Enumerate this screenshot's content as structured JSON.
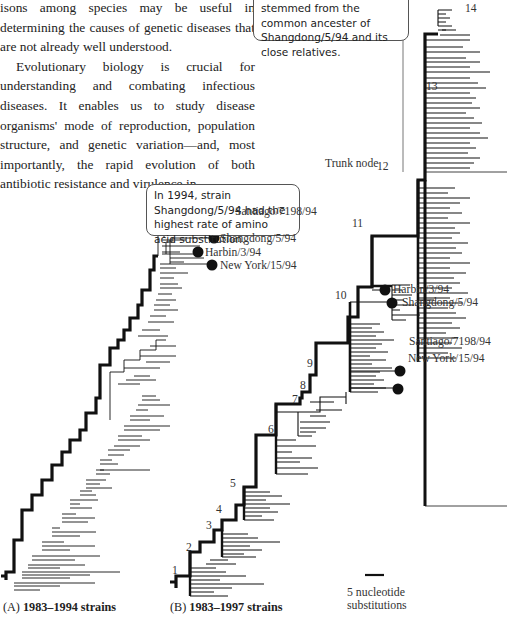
{
  "body_text": {
    "paragraph1": "isons among species may be useful in determining the causes of genetic diseases that are not already well understood.",
    "paragraph2": "Evolutionary biology is crucial for understanding and combating infectious diseases. It enables us to study disease organisms' mode of reproduction, population structure, and genetic variation—and, most importantly, the rapid evolution of both antibiotic resistance and virulence in"
  },
  "callouts": {
    "top": "stemmed from the common ancester of Shangdong/5/94 and its close relatives.",
    "middle": "In 1994, strain Shangdong/5/94 had the highest rate of amino acid substitution."
  },
  "tree_a": {
    "caption_letter": "(A)",
    "caption_title": "1983–1994 strains",
    "strains": [
      {
        "label": "Santiago/7198/94"
      },
      {
        "label": "Shangdong/5/94"
      },
      {
        "label": "Harbin/3/94"
      },
      {
        "label": "New York/15/94"
      }
    ]
  },
  "tree_b": {
    "caption_letter": "(B)",
    "caption_title": "1983–1997 strains",
    "trunk_node_label": "Trunk node",
    "nodes": [
      "1",
      "2",
      "3",
      "4",
      "5",
      "6",
      "7",
      "8",
      "9",
      "10",
      "11",
      "12",
      "13",
      "14"
    ],
    "strains": [
      {
        "label": "Shangdong/5/94"
      },
      {
        "label": "Harbin/3/94"
      },
      {
        "label": "Santiago/7198/94"
      },
      {
        "label": "New York/15/94"
      }
    ]
  },
  "scale_bar": {
    "line1": "5 nucleotide",
    "line2": "substitutions"
  }
}
